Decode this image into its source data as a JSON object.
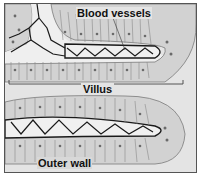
{
  "diagram": {
    "labels": {
      "blood_vessels": "Blood vessels",
      "villus": "Villus",
      "outer_wall": "Outer wall"
    },
    "colors": {
      "background": "#e4e4e4",
      "cell_fill": "#d2d2d2",
      "cell_line": "#7a7a7a",
      "nucleus": "#6a6a6a",
      "vessel": "#1a1a1a",
      "core": "#f0f0f0"
    }
  }
}
